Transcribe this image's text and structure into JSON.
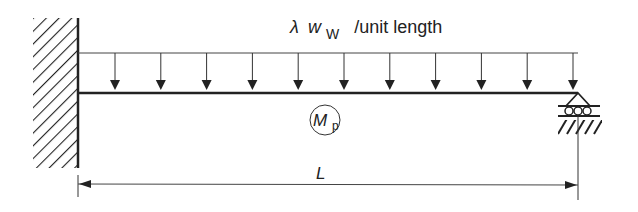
{
  "load": {
    "symbol": "λ",
    "variable": "w",
    "subscript": "W",
    "unit_text": "/unit length",
    "arrow_count": 11
  },
  "beam": {
    "moment_symbol": "M",
    "moment_subscript": "p"
  },
  "dimension": {
    "label": "L"
  },
  "supports": {
    "left": "fixed-wall",
    "right": "roller"
  },
  "colors": {
    "line": "#222222",
    "background": "#ffffff"
  }
}
